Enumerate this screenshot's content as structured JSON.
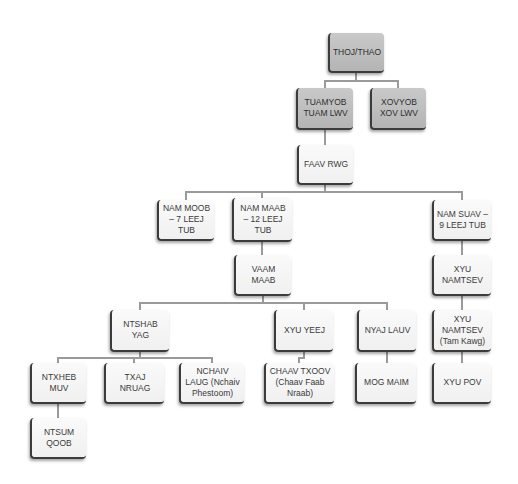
{
  "diagram": {
    "type": "org-chart",
    "nodes": [
      {
        "id": "thoj_thao",
        "label": "THOJ/THAO",
        "style": "dark",
        "x": 328,
        "y": 33,
        "w": 56,
        "h": 40
      },
      {
        "id": "tuamyob",
        "label": "TUAMYOB TUAM LWV",
        "style": "dark",
        "x": 296,
        "y": 88,
        "w": 57,
        "h": 42
      },
      {
        "id": "xovyob",
        "label": "XOVYOB XOV LWV",
        "style": "dark",
        "x": 370,
        "y": 88,
        "w": 56,
        "h": 42
      },
      {
        "id": "faav_rwg",
        "label": "FAAV RWG",
        "style": "light",
        "x": 297,
        "y": 145,
        "w": 56,
        "h": 40
      },
      {
        "id": "nam_moob",
        "label": "NAM MOOB – 7 LEEJ TUB",
        "style": "light",
        "x": 157,
        "y": 200,
        "w": 57,
        "h": 41
      },
      {
        "id": "nam_maab",
        "label": "NAM MAAB – 12 LEEJ TUB",
        "style": "light",
        "x": 232,
        "y": 198,
        "w": 60,
        "h": 44
      },
      {
        "id": "nam_suav",
        "label": "NAM SUAV – 9 LEEJ TUB",
        "style": "light",
        "x": 432,
        "y": 200,
        "w": 59,
        "h": 41
      },
      {
        "id": "vaam_maab",
        "label": "VAAM MAAB",
        "style": "light",
        "x": 234,
        "y": 255,
        "w": 57,
        "h": 41
      },
      {
        "id": "xyu_namtsev",
        "label": "XYU NAMTSEV",
        "style": "light",
        "x": 432,
        "y": 255,
        "w": 59,
        "h": 41
      },
      {
        "id": "ntshab_yag",
        "label": "NTSHAB YAG",
        "style": "light",
        "x": 110,
        "y": 310,
        "w": 59,
        "h": 42
      },
      {
        "id": "xyu_yeej",
        "label": "XYU YEEJ",
        "style": "light",
        "x": 274,
        "y": 310,
        "w": 59,
        "h": 42
      },
      {
        "id": "nyaj_lauv",
        "label": "NYAJ LAUV",
        "style": "light",
        "x": 357,
        "y": 310,
        "w": 59,
        "h": 42
      },
      {
        "id": "xyu_namtsev_tk",
        "label": "XYU NAMTSEV (Tam Kawg)",
        "style": "light",
        "x": 432,
        "y": 310,
        "w": 59,
        "h": 42
      },
      {
        "id": "ntxheb_muv",
        "label": "NTXHEB MUV",
        "style": "light",
        "x": 30,
        "y": 363,
        "w": 56,
        "h": 41
      },
      {
        "id": "txaj_nruag",
        "label": "TXAJ NRUAG",
        "style": "light",
        "x": 104,
        "y": 363,
        "w": 60,
        "h": 41
      },
      {
        "id": "nchaiv_laug",
        "label": "NCHAIV LAUG (Nchaiv Phestoom)",
        "style": "light",
        "x": 179,
        "y": 363,
        "w": 65,
        "h": 41
      },
      {
        "id": "chaav_txoov",
        "label": "CHAAV TXOOV (Chaav Faab Nraab)",
        "style": "light",
        "x": 264,
        "y": 363,
        "w": 70,
        "h": 41
      },
      {
        "id": "mog_maim",
        "label": "MOG MAIM",
        "style": "light",
        "x": 355,
        "y": 363,
        "w": 61,
        "h": 41
      },
      {
        "id": "xyu_pov",
        "label": "XYU POV",
        "style": "light",
        "x": 432,
        "y": 363,
        "w": 59,
        "h": 41
      },
      {
        "id": "ntsum_qoob",
        "label": "NTSUM QOOB",
        "style": "light",
        "x": 30,
        "y": 418,
        "w": 56,
        "h": 41
      }
    ],
    "edges": [
      [
        "thoj_thao",
        "tuamyob"
      ],
      [
        "thoj_thao",
        "xovyob"
      ],
      [
        "tuamyob",
        "faav_rwg"
      ],
      [
        "faav_rwg",
        "nam_moob"
      ],
      [
        "faav_rwg",
        "nam_maab"
      ],
      [
        "faav_rwg",
        "nam_suav"
      ],
      [
        "nam_maab",
        "vaam_maab"
      ],
      [
        "nam_suav",
        "xyu_namtsev"
      ],
      [
        "vaam_maab",
        "ntshab_yag"
      ],
      [
        "vaam_maab",
        "xyu_yeej"
      ],
      [
        "vaam_maab",
        "nyaj_lauv"
      ],
      [
        "xyu_namtsev",
        "xyu_namtsev_tk"
      ],
      [
        "ntshab_yag",
        "ntxheb_muv"
      ],
      [
        "ntshab_yag",
        "txaj_nruag"
      ],
      [
        "ntshab_yag",
        "nchaiv_laug"
      ],
      [
        "xyu_yeej",
        "chaav_txoov"
      ],
      [
        "nyaj_lauv",
        "mog_maim"
      ],
      [
        "xyu_namtsev_tk",
        "xyu_pov"
      ],
      [
        "ntxheb_muv",
        "ntsum_qoob"
      ]
    ]
  }
}
